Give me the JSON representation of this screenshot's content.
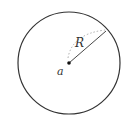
{
  "diagram": {
    "labels": {
      "radius": "R",
      "center": "a"
    },
    "colors": {
      "stroke": "#333333",
      "dotted": "#aaaaaa",
      "background": "#ffffff"
    }
  }
}
